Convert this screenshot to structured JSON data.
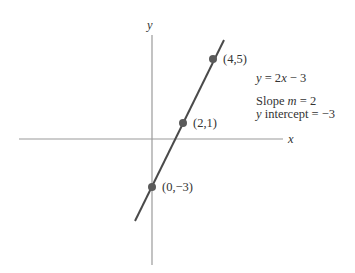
{
  "diagram": {
    "axes": {
      "x_label": "x",
      "y_label": "y",
      "origin_px": [
        152,
        139
      ],
      "px_per_unit_x": 15.4,
      "px_per_unit_y": 16
    },
    "line": {
      "equation": "y = 2x − 3",
      "slope": 2,
      "intercept": -3,
      "color": "#4a4a4a"
    },
    "points": [
      {
        "x": 4,
        "y": 5,
        "label": "(4,5)"
      },
      {
        "x": 2,
        "y": 1,
        "label": "(2,1)"
      },
      {
        "x": 0,
        "y": -3,
        "label": "(0,−3)"
      }
    ],
    "annotations": {
      "equation_y": "y",
      "equation_rest": " = 2",
      "equation_x": "x",
      "equation_tail": " − 3",
      "slope_prefix": "Slope ",
      "slope_var": "m",
      "slope_value": " = 2",
      "intercept_var": "y",
      "intercept_rest": " intercept = −3"
    },
    "colors": {
      "axis": "#9a9a9a",
      "point": "#5a5a5a",
      "text": "#333333"
    }
  }
}
